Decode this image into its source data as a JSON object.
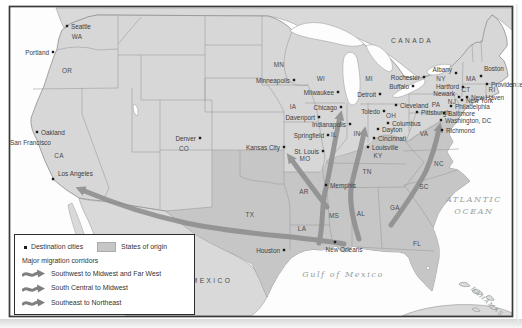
{
  "region_labels": {
    "canada": "CANADA",
    "mexico": "MEXICO",
    "gulf_of_mexico": "Gulf of Mexico",
    "atlantic_line1": "ATLANTIC",
    "atlantic_line2": "OCEAN",
    "bahamas": "BAHAMAS"
  },
  "states": [
    {
      "id": "WA",
      "x": 77,
      "y": 39
    },
    {
      "id": "OR",
      "x": 67,
      "y": 73
    },
    {
      "id": "CA",
      "x": 59,
      "y": 158
    },
    {
      "id": "CO",
      "x": 184,
      "y": 151
    },
    {
      "id": "MN",
      "x": 279,
      "y": 67
    },
    {
      "id": "WI",
      "x": 321,
      "y": 81
    },
    {
      "id": "MI",
      "x": 369,
      "y": 81
    },
    {
      "id": "IA",
      "x": 293,
      "y": 109
    },
    {
      "id": "IL",
      "x": 334,
      "y": 137
    },
    {
      "id": "IN",
      "x": 357,
      "y": 136
    },
    {
      "id": "OH",
      "x": 391,
      "y": 118
    },
    {
      "id": "PA",
      "x": 436,
      "y": 107
    },
    {
      "id": "NY",
      "x": 441,
      "y": 81
    },
    {
      "id": "MA",
      "x": 471,
      "y": 81
    },
    {
      "id": "RI",
      "x": 492,
      "y": 92
    },
    {
      "id": "CT",
      "x": 466,
      "y": 92
    },
    {
      "id": "NJ",
      "x": 452,
      "y": 104
    },
    {
      "id": "MO",
      "x": 305,
      "y": 161
    },
    {
      "id": "AR",
      "x": 304,
      "y": 194
    },
    {
      "id": "LA",
      "x": 302,
      "y": 231
    },
    {
      "id": "TX",
      "x": 250,
      "y": 217
    },
    {
      "id": "MS",
      "x": 334,
      "y": 218
    },
    {
      "id": "AL",
      "x": 361,
      "y": 216
    },
    {
      "id": "TN",
      "x": 367,
      "y": 174
    },
    {
      "id": "KY",
      "x": 378,
      "y": 158
    },
    {
      "id": "GA",
      "x": 395,
      "y": 210
    },
    {
      "id": "SC",
      "x": 424,
      "y": 189
    },
    {
      "id": "NC",
      "x": 439,
      "y": 166
    },
    {
      "id": "VA",
      "x": 424,
      "y": 136
    },
    {
      "id": "FL",
      "x": 417,
      "y": 246
    }
  ],
  "cities": [
    {
      "name": "Seattle",
      "dot": [
        67,
        26
      ],
      "lx": 71,
      "ly": 29,
      "anchor": "start"
    },
    {
      "name": "Portland",
      "dot": [
        53,
        52
      ],
      "lx": 49,
      "ly": 55,
      "anchor": "end"
    },
    {
      "name": "Oakland",
      "dot": [
        37,
        132
      ],
      "lx": 41,
      "ly": 135,
      "anchor": "start"
    },
    {
      "name": "San Francisco",
      "dot": null,
      "lx": 10,
      "ly": 145,
      "anchor": "start"
    },
    {
      "name": "Los Angeles",
      "dot": [
        53,
        179
      ],
      "lx": 58,
      "ly": 176,
      "anchor": "start"
    },
    {
      "name": "Denver",
      "dot": [
        200,
        138
      ],
      "lx": 196,
      "ly": 141,
      "anchor": "end"
    },
    {
      "name": "Minneapolis",
      "dot": [
        294,
        80
      ],
      "lx": 290,
      "ly": 83,
      "anchor": "end"
    },
    {
      "name": "Milwaukee",
      "dot": [
        338,
        92
      ],
      "lx": 334,
      "ly": 95,
      "anchor": "end"
    },
    {
      "name": "Chicago",
      "dot": [
        341,
        107
      ],
      "lx": 337,
      "ly": 110,
      "anchor": "end"
    },
    {
      "name": "Davenport",
      "dot": [
        319,
        117
      ],
      "lx": 315,
      "ly": 120,
      "anchor": "end"
    },
    {
      "name": "Springfield",
      "dot": [
        328,
        135
      ],
      "lx": 324,
      "ly": 138,
      "anchor": "end"
    },
    {
      "name": "St. Louis",
      "dot": [
        323,
        151
      ],
      "lx": 319,
      "ly": 154,
      "anchor": "end"
    },
    {
      "name": "Kansas City",
      "dot": [
        284,
        147
      ],
      "lx": 280,
      "ly": 150,
      "anchor": "end"
    },
    {
      "name": "Memphis",
      "dot": [
        326,
        185
      ],
      "lx": 330,
      "ly": 188,
      "anchor": "start"
    },
    {
      "name": "Houston",
      "dot": [
        284,
        250
      ],
      "lx": 280,
      "ly": 253,
      "anchor": "end"
    },
    {
      "name": "New Orleans",
      "dot": [
        335,
        242
      ],
      "lx": 344,
      "ly": 252,
      "anchor": "middle"
    },
    {
      "name": "Indianapolis",
      "dot": [
        350,
        124
      ],
      "lx": 346,
      "ly": 127,
      "anchor": "end"
    },
    {
      "name": "Louisville",
      "dot": [
        368,
        147
      ],
      "lx": 372,
      "ly": 150,
      "anchor": "start"
    },
    {
      "name": "Cincinnati",
      "dot": [
        374,
        138
      ],
      "lx": 378,
      "ly": 141,
      "anchor": "start"
    },
    {
      "name": "Dayton",
      "dot": [
        378,
        129
      ],
      "lx": 382,
      "ly": 132,
      "anchor": "start"
    },
    {
      "name": "Columbus",
      "dot": [
        388,
        123
      ],
      "lx": 392,
      "ly": 126,
      "anchor": "start"
    },
    {
      "name": "Toledo",
      "dot": [
        384,
        111
      ],
      "lx": 380,
      "ly": 114,
      "anchor": "end"
    },
    {
      "name": "Detroit",
      "dot": [
        380,
        94
      ],
      "lx": 376,
      "ly": 97,
      "anchor": "end"
    },
    {
      "name": "Cleveland",
      "dot": [
        396,
        105
      ],
      "lx": 400,
      "ly": 108,
      "anchor": "start"
    },
    {
      "name": "Pittsburgh",
      "dot": [
        417,
        112
      ],
      "lx": 421,
      "ly": 115,
      "anchor": "start"
    },
    {
      "name": "Buffalo",
      "dot": [
        413,
        86
      ],
      "lx": 409,
      "ly": 89,
      "anchor": "end"
    },
    {
      "name": "Rochester",
      "dot": [
        424,
        77
      ],
      "lx": 420,
      "ly": 80,
      "anchor": "end"
    },
    {
      "name": "Albany",
      "dot": [
        456,
        73
      ],
      "lx": 452,
      "ly": 72,
      "anchor": "end"
    },
    {
      "name": "Boston",
      "dot": [
        481,
        76
      ],
      "lx": 484,
      "ly": 71,
      "anchor": "start"
    },
    {
      "name": "Providence",
      "dot": [
        487,
        84
      ],
      "lx": 491,
      "ly": 87,
      "anchor": "start"
    },
    {
      "name": "Hartford",
      "dot": [
        463,
        87
      ],
      "lx": 459,
      "ly": 89,
      "anchor": "end"
    },
    {
      "name": "New Haven",
      "dot": [
        467,
        97
      ],
      "lx": 471,
      "ly": 100,
      "anchor": "start"
    },
    {
      "name": "Newark",
      "dot": [
        459,
        97
      ],
      "lx": 455,
      "ly": 96,
      "anchor": "end"
    },
    {
      "name": "New York",
      "dot": [
        462,
        100
      ],
      "lx": 466,
      "ly": 103,
      "anchor": "start"
    },
    {
      "name": "Philadelphia",
      "dot": [
        451,
        106
      ],
      "lx": 455,
      "ly": 109,
      "anchor": "start"
    },
    {
      "name": "Baltimore",
      "dot": [
        444,
        113
      ],
      "lx": 448,
      "ly": 116,
      "anchor": "start"
    },
    {
      "name": "Washington, DC",
      "dot": [
        441,
        120
      ],
      "lx": 445,
      "ly": 123,
      "anchor": "start"
    },
    {
      "name": "Richmond",
      "dot": [
        442,
        130
      ],
      "lx": 446,
      "ly": 133,
      "anchor": "start"
    }
  ],
  "legend": {
    "destination_label": "Destination cities",
    "origin_label": "States of origin",
    "corridors_title": "Major migration corridors",
    "corridor_items": [
      "Southwest to Midwest and Far West",
      "South Central to Midwest",
      "Southeast to Northeast"
    ]
  },
  "colors": {
    "land": "#d7d7d7",
    "origin_states": "#c6c6c6",
    "water": "#fdfdfd",
    "corridor": "#8e8e8e",
    "city_dot": "#1c1c1c",
    "state_border": "#9e9e9e",
    "frame": "#3a3a3a",
    "label": "#3d3d3d",
    "ocean_label": "#98a09e"
  }
}
